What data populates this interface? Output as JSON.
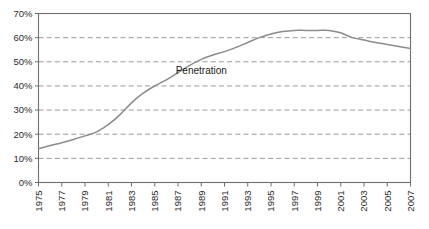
{
  "chart_data": {
    "type": "line",
    "title": "",
    "xlabel": "",
    "ylabel": "",
    "grid": true,
    "legend_position": "inline-annotation",
    "xlim": [
      1975,
      2007
    ],
    "ylim": [
      0,
      70
    ],
    "ytick_labels": [
      "70%",
      "60%",
      "50%",
      "40%",
      "30%",
      "20%",
      "10%",
      "0%"
    ],
    "ytick_values": [
      70,
      60,
      50,
      40,
      30,
      20,
      10,
      0
    ],
    "gridline_values": [
      60,
      50,
      40,
      30,
      20,
      10
    ],
    "xtick_labels": [
      "1975",
      "1977",
      "1979",
      "1981",
      "1983",
      "1985",
      "1987",
      "1989",
      "1991",
      "1993",
      "1995",
      "1997",
      "1999",
      "2001",
      "2003",
      "2005",
      "2007"
    ],
    "xtick_values": [
      1975,
      1977,
      1979,
      1981,
      1983,
      1985,
      1987,
      1989,
      1991,
      1993,
      1995,
      1997,
      1999,
      2001,
      2003,
      2005,
      2007
    ],
    "annotations": [
      {
        "text": "Penetration",
        "x": 1989,
        "y": 45
      }
    ],
    "series": [
      {
        "name": "Penetration",
        "color": "#8c8c8c",
        "x": [
          1975,
          1976,
          1977,
          1978,
          1979,
          1980,
          1981,
          1982,
          1983,
          1984,
          1985,
          1986,
          1987,
          1988,
          1989,
          1990,
          1991,
          1992,
          1993,
          1994,
          1995,
          1996,
          1997,
          1998,
          1999,
          2000,
          2001,
          2002,
          2003,
          2004,
          2005,
          2006,
          2007
        ],
        "values": [
          14.0,
          15.3,
          16.5,
          17.8,
          19.3,
          21.0,
          24.0,
          28.0,
          33.0,
          37.0,
          40.0,
          42.5,
          45.5,
          48.5,
          51.0,
          52.8,
          54.2,
          56.0,
          58.0,
          60.0,
          61.5,
          62.5,
          63.0,
          63.0,
          63.0,
          63.0,
          62.0,
          60.0,
          59.0,
          58.0,
          57.2,
          56.3,
          55.5
        ]
      }
    ]
  },
  "axis": {
    "frame_color": "#6e6e6e",
    "grid_color": "#9a9a9a",
    "tick_color": "#6e6e6e"
  }
}
